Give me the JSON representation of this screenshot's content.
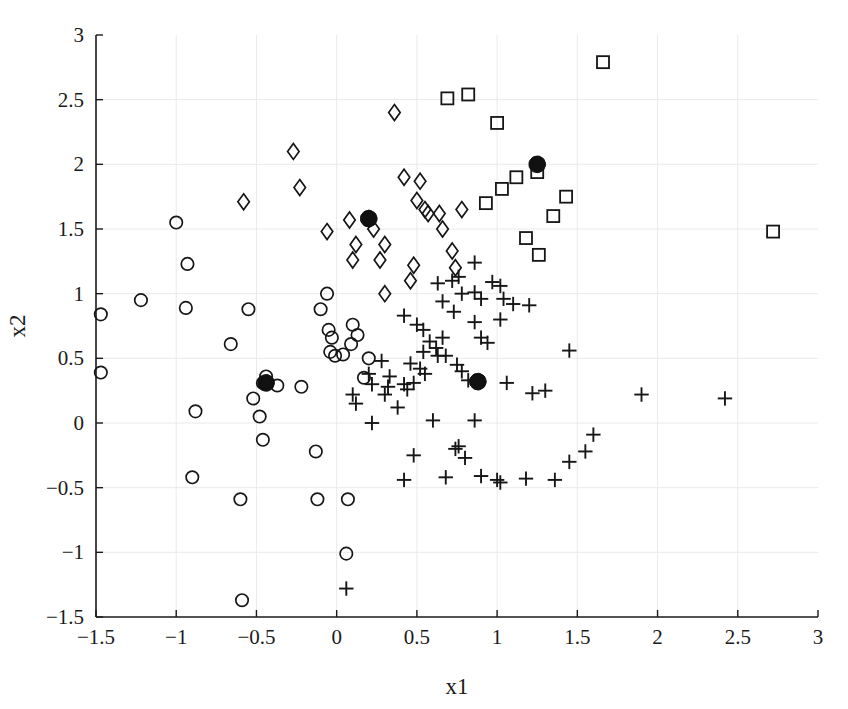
{
  "chart_data": {
    "type": "scatter",
    "title": "",
    "xlabel": "x1",
    "ylabel": "x2",
    "xlim": [
      -1.5,
      3
    ],
    "ylim": [
      -1.5,
      3
    ],
    "xticks": [
      -1.5,
      -1,
      -0.5,
      0,
      0.5,
      1,
      1.5,
      2,
      2.5,
      3
    ],
    "xticklabels": [
      "-1.5",
      "-1",
      "-0.5",
      "0",
      "0.5",
      "1",
      "1.5",
      "2",
      "2.5",
      "3"
    ],
    "yticks": [
      -1.5,
      -1,
      -0.5,
      0,
      0.5,
      1,
      1.5,
      2,
      2.5,
      3
    ],
    "yticklabels": [
      "-1.5",
      "-1",
      "-0.5",
      "0",
      "0.5",
      "1",
      "1.5",
      "2",
      "2.5",
      "3"
    ],
    "grid": true,
    "legend": "none",
    "marker_color": "#161616",
    "centroid_color": "#111111",
    "series": [
      {
        "name": "cluster-circles",
        "marker": "circle",
        "points": [
          [
            -1.47,
            0.84
          ],
          [
            -1.47,
            0.39
          ],
          [
            -1.22,
            0.95
          ],
          [
            -1.0,
            1.55
          ],
          [
            -0.94,
            0.89
          ],
          [
            -0.93,
            1.23
          ],
          [
            -0.88,
            0.09
          ],
          [
            -0.9,
            -0.42
          ],
          [
            -0.66,
            0.61
          ],
          [
            -0.6,
            -0.59
          ],
          [
            -0.59,
            -1.37
          ],
          [
            -0.55,
            0.88
          ],
          [
            -0.52,
            0.19
          ],
          [
            -0.48,
            0.05
          ],
          [
            -0.46,
            0.31
          ],
          [
            -0.46,
            -0.13
          ],
          [
            -0.44,
            0.36
          ],
          [
            -0.37,
            0.29
          ],
          [
            -0.22,
            0.28
          ],
          [
            -0.13,
            -0.22
          ],
          [
            -0.12,
            -0.59
          ],
          [
            -0.1,
            0.88
          ],
          [
            -0.06,
            1.0
          ],
          [
            -0.05,
            0.72
          ],
          [
            -0.03,
            0.66
          ],
          [
            -0.04,
            0.55
          ],
          [
            -0.01,
            0.52
          ],
          [
            0.06,
            -1.01
          ],
          [
            0.07,
            -0.59
          ],
          [
            0.1,
            0.76
          ],
          [
            0.09,
            0.61
          ],
          [
            0.17,
            0.35
          ],
          [
            0.13,
            0.68
          ],
          [
            0.2,
            0.5
          ],
          [
            0.04,
            0.53
          ]
        ]
      },
      {
        "name": "cluster-diamonds",
        "marker": "diamond",
        "points": [
          [
            -0.58,
            1.71
          ],
          [
            -0.23,
            1.82
          ],
          [
            -0.27,
            2.1
          ],
          [
            -0.06,
            1.48
          ],
          [
            0.08,
            1.57
          ],
          [
            0.12,
            1.38
          ],
          [
            0.1,
            1.26
          ],
          [
            0.23,
            1.5
          ],
          [
            0.3,
            1.38
          ],
          [
            0.27,
            1.26
          ],
          [
            0.3,
            1.0
          ],
          [
            0.36,
            2.4
          ],
          [
            0.42,
            1.9
          ],
          [
            0.52,
            1.87
          ],
          [
            0.5,
            1.72
          ],
          [
            0.55,
            1.65
          ],
          [
            0.48,
            1.22
          ],
          [
            0.46,
            1.1
          ],
          [
            0.57,
            1.62
          ],
          [
            0.64,
            1.62
          ],
          [
            0.66,
            1.5
          ],
          [
            0.72,
            1.33
          ],
          [
            0.74,
            1.2
          ],
          [
            0.78,
            1.65
          ],
          [
            0.2,
            1.58
          ]
        ]
      },
      {
        "name": "cluster-squares",
        "marker": "square",
        "points": [
          [
            0.69,
            2.51
          ],
          [
            0.82,
            2.54
          ],
          [
            1.0,
            2.32
          ],
          [
            1.66,
            2.79
          ],
          [
            1.03,
            1.81
          ],
          [
            1.12,
            1.9
          ],
          [
            1.25,
            1.94
          ],
          [
            0.93,
            1.7
          ],
          [
            1.35,
            1.6
          ],
          [
            1.18,
            1.43
          ],
          [
            1.26,
            1.3
          ],
          [
            1.43,
            1.75
          ],
          [
            2.72,
            1.48
          ]
        ]
      },
      {
        "name": "cluster-plus",
        "marker": "plus",
        "points": [
          [
            0.42,
            0.83
          ],
          [
            0.5,
            0.76
          ],
          [
            0.54,
            0.72
          ],
          [
            0.58,
            0.63
          ],
          [
            0.63,
            1.08
          ],
          [
            0.66,
            0.94
          ],
          [
            0.72,
            1.1
          ],
          [
            0.76,
            1.13
          ],
          [
            0.78,
            1.0
          ],
          [
            0.73,
            0.86
          ],
          [
            0.86,
            1.01
          ],
          [
            0.9,
            0.96
          ],
          [
            0.97,
            1.09
          ],
          [
            1.02,
            1.06
          ],
          [
            1.04,
            0.96
          ],
          [
            1.1,
            0.92
          ],
          [
            1.2,
            0.91
          ],
          [
            1.02,
            0.8
          ],
          [
            0.86,
            0.78
          ],
          [
            0.9,
            0.66
          ],
          [
            0.94,
            0.62
          ],
          [
            0.66,
            0.66
          ],
          [
            0.62,
            0.58
          ],
          [
            0.63,
            0.52
          ],
          [
            0.54,
            0.55
          ],
          [
            0.52,
            0.42
          ],
          [
            0.55,
            0.38
          ],
          [
            0.68,
            0.52
          ],
          [
            0.75,
            0.45
          ],
          [
            0.78,
            0.4
          ],
          [
            0.88,
            0.31
          ],
          [
            0.82,
            0.33
          ],
          [
            1.06,
            0.31
          ],
          [
            1.22,
            0.23
          ],
          [
            1.45,
            0.56
          ],
          [
            0.46,
            0.46
          ],
          [
            0.42,
            0.3
          ],
          [
            0.44,
            0.26
          ],
          [
            0.48,
            0.31
          ],
          [
            0.38,
            0.12
          ],
          [
            0.33,
            0.36
          ],
          [
            0.28,
            0.48
          ],
          [
            0.32,
            0.28
          ],
          [
            0.3,
            0.22
          ],
          [
            0.2,
            0.38
          ],
          [
            0.22,
            0.3
          ],
          [
            0.6,
            0.02
          ],
          [
            0.86,
            0.02
          ],
          [
            0.74,
            -0.2
          ],
          [
            0.76,
            -0.18
          ],
          [
            0.8,
            -0.27
          ],
          [
            0.48,
            -0.25
          ],
          [
            0.42,
            -0.44
          ],
          [
            0.68,
            -0.42
          ],
          [
            0.9,
            -0.41
          ],
          [
            1.0,
            -0.44
          ],
          [
            1.02,
            -0.46
          ],
          [
            1.18,
            -0.43
          ],
          [
            1.36,
            -0.44
          ],
          [
            1.45,
            -0.3
          ],
          [
            1.55,
            -0.22
          ],
          [
            1.6,
            -0.09
          ],
          [
            1.9,
            0.22
          ],
          [
            2.42,
            0.19
          ],
          [
            0.06,
            -1.28
          ],
          [
            0.22,
            0.0
          ],
          [
            0.1,
            0.22
          ],
          [
            0.12,
            0.15
          ],
          [
            1.3,
            0.25
          ],
          [
            0.86,
            1.24
          ]
        ]
      },
      {
        "name": "centroids",
        "marker": "centroid",
        "points": [
          [
            -0.44,
            0.31
          ],
          [
            0.2,
            1.58
          ],
          [
            1.25,
            2.0
          ],
          [
            0.88,
            0.32
          ]
        ]
      }
    ]
  },
  "axes": {
    "xlabel": "x1",
    "ylabel": "x2"
  }
}
